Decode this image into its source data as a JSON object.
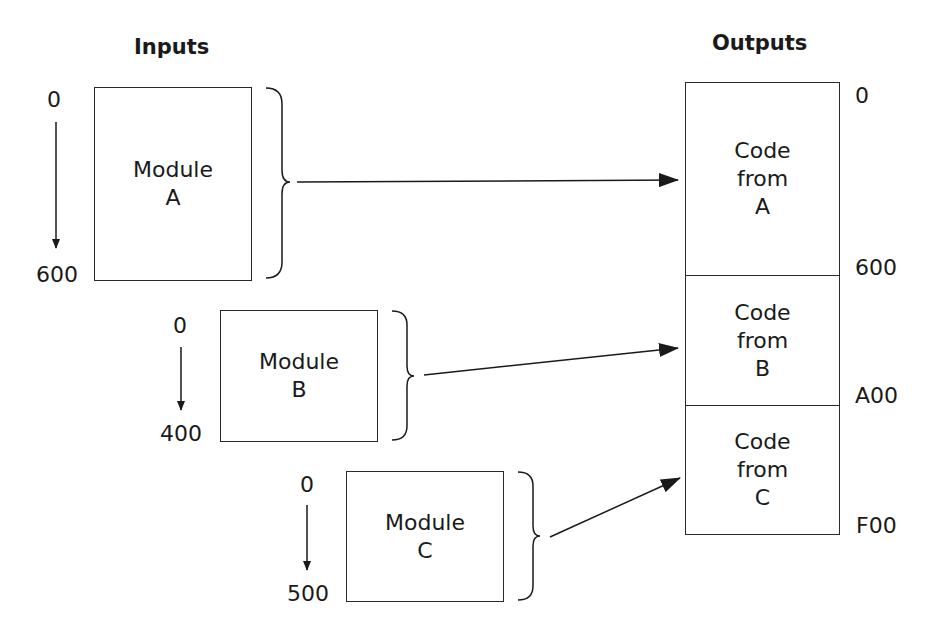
{
  "headings": {
    "inputs": "Inputs",
    "outputs": "Outputs"
  },
  "modules": [
    {
      "name": "Module",
      "letter": "A",
      "start": "0",
      "end": "600"
    },
    {
      "name": "Module",
      "letter": "B",
      "start": "0",
      "end": "400"
    },
    {
      "name": "Module",
      "letter": "C",
      "start": "0",
      "end": "500"
    }
  ],
  "output": {
    "segments": [
      {
        "line1": "Code",
        "line2": "from",
        "line3": "A"
      },
      {
        "line1": "Code",
        "line2": "from",
        "line3": "B"
      },
      {
        "line1": "Code",
        "line2": "from",
        "line3": "C"
      }
    ],
    "addresses": [
      "0",
      "600",
      "A00",
      "F00"
    ]
  },
  "colors": {
    "stroke": "#1a1a1a",
    "background": "#ffffff"
  }
}
